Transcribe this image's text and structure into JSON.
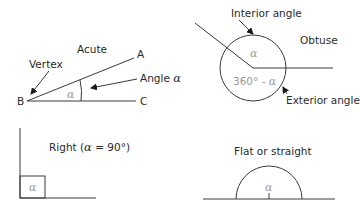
{
  "acute": {
    "title": "Acute",
    "vertex_label": "Vertex",
    "angle_label": "Angle ",
    "angle_symbol": "α",
    "point_a": "A",
    "point_b": "B",
    "point_c": "C",
    "inner_symbol": "α"
  },
  "obtuse": {
    "title": "Obtuse",
    "interior_label": "Interior angle",
    "exterior_label": "Exterior angle",
    "interior_symbol": "α",
    "exterior_value": "360° - ",
    "exterior_symbol": "α"
  },
  "right": {
    "title_prefix": "Right (",
    "title_symbol": "α",
    "title_suffix": " = 90°)",
    "inner_symbol": "α"
  },
  "flat": {
    "title": "Flat or straight",
    "inner_symbol": "α"
  }
}
